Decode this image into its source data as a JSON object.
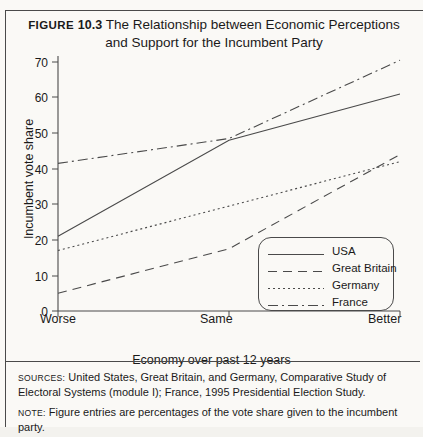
{
  "figure": {
    "number_label": "Figure",
    "number": "10.3",
    "title_line1": "The Relationship between Economic Perceptions",
    "title_line2": "and Support for the Incumbent Party"
  },
  "notes": [
    {
      "head": "Sources:",
      "text": "United States, Great Britain, and Germany, Comparative Study of Electoral Systems (module I); France, 1995 Presidential Election Study."
    },
    {
      "head": "Note:",
      "text": "Figure entries are percentages of the vote share given to the incumbent party."
    }
  ],
  "chart_data": {
    "type": "line",
    "title": "The Relationship between Economic Perceptions and Support for the Incumbent Party",
    "xlabel": "Economy over past 12 years",
    "ylabel": "Incumbent vote share",
    "categories": [
      "Worse",
      "Same",
      "Better"
    ],
    "x": [
      0,
      1,
      2
    ],
    "ylim": [
      0,
      70
    ],
    "yticks": [
      0,
      10,
      20,
      30,
      40,
      50,
      60,
      70
    ],
    "grid": false,
    "legend_position": "bottom-right",
    "series": [
      {
        "name": "USA",
        "style": "solid",
        "values": [
          21,
          48,
          61
        ]
      },
      {
        "name": "Great Britain",
        "style": "dashed",
        "values": [
          5,
          17.5,
          44
        ]
      },
      {
        "name": "Germany",
        "style": "dotted",
        "values": [
          17,
          29.5,
          42
        ]
      },
      {
        "name": "France",
        "style": "dashdot",
        "values": [
          41.5,
          48.5,
          70.5
        ]
      }
    ]
  },
  "colors": {
    "line": "#4a4a4a",
    "text": "#1a1a1a",
    "background": "#faf9f6"
  }
}
